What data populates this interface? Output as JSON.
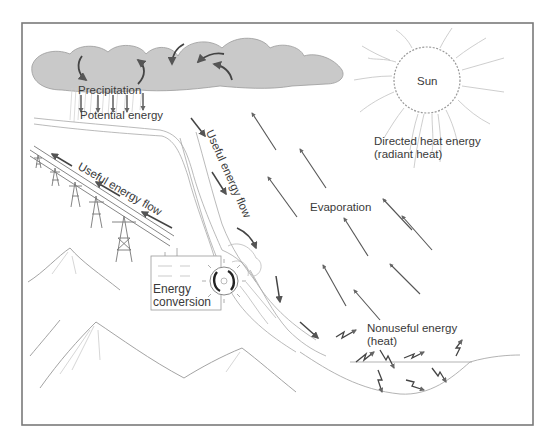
{
  "diagram": {
    "colors": {
      "frame": "#7a7a7a",
      "ink": "#3a3a3a",
      "cloud": "#9a9a9a",
      "sketch": "#b5b5b5"
    },
    "labels": {
      "precipitation": "Precipitation",
      "potential_energy": "Potential energy",
      "sun": "Sun",
      "directed_heat_line1": "Directed heat energy",
      "directed_heat_line2": "(radiant heat)",
      "useful_flow_waterfall": "Useful energy flow",
      "useful_flow_powerlines": "Useful energy flow",
      "evaporation": "Evaporation",
      "energy_conversion_line1": "Energy",
      "energy_conversion_line2": "conversion",
      "nonuseful_line1": "Nonuseful energy",
      "nonuseful_line2": "(heat)"
    },
    "nodes": [
      {
        "id": "sun",
        "label": "Sun"
      },
      {
        "id": "clouds",
        "label": "Precipitation"
      },
      {
        "id": "waterfall",
        "label": "Potential energy"
      },
      {
        "id": "power-plant",
        "label": "Energy conversion"
      },
      {
        "id": "power-lines",
        "label": "Useful energy flow"
      },
      {
        "id": "lake",
        "label": "Nonuseful energy (heat)"
      }
    ],
    "edges": [
      {
        "from": "sun",
        "to": "lake",
        "label": "Directed heat energy (radiant heat)"
      },
      {
        "from": "lake",
        "to": "clouds",
        "label": "Evaporation"
      },
      {
        "from": "clouds",
        "to": "waterfall",
        "label": "Precipitation"
      },
      {
        "from": "waterfall",
        "to": "power-plant",
        "label": "Useful energy flow"
      },
      {
        "from": "power-plant",
        "to": "power-lines",
        "label": "Useful energy flow"
      },
      {
        "from": "power-plant",
        "to": "lake",
        "label": "Nonuseful energy (heat)"
      }
    ]
  }
}
